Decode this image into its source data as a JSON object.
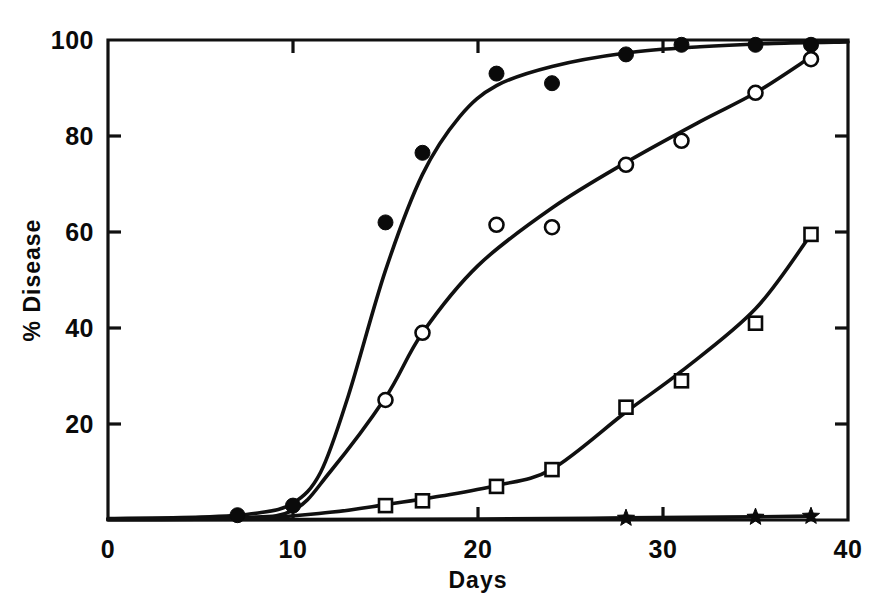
{
  "chart_data": {
    "type": "scatter",
    "title": "",
    "xlabel": "Days",
    "ylabel": "% Disease",
    "xlim": [
      0,
      40
    ],
    "ylim": [
      0,
      100
    ],
    "xticks": [
      0,
      10,
      20,
      30,
      40
    ],
    "yticks": [
      0,
      20,
      40,
      60,
      80,
      100
    ],
    "xtick_labels": [
      "0",
      "10",
      "20",
      "30",
      "40"
    ],
    "ytick_labels": [
      "0",
      "20",
      "40",
      "60",
      "80",
      "100"
    ],
    "grid": false,
    "legend_position": "none",
    "series": [
      {
        "name": "series-filled-circle",
        "marker": "filled-circle",
        "points": [
          {
            "x": 7,
            "y": 1.0
          },
          {
            "x": 10,
            "y": 3.0
          },
          {
            "x": 15,
            "y": 62.0
          },
          {
            "x": 17,
            "y": 76.5
          },
          {
            "x": 21,
            "y": 93.0
          },
          {
            "x": 24,
            "y": 91.0
          },
          {
            "x": 28,
            "y": 97.0
          },
          {
            "x": 31,
            "y": 99.0
          },
          {
            "x": 35,
            "y": 99.0
          },
          {
            "x": 38,
            "y": 99.0
          }
        ],
        "curve": [
          {
            "x": 0,
            "y": 0.3
          },
          {
            "x": 5,
            "y": 0.6
          },
          {
            "x": 8,
            "y": 1.4
          },
          {
            "x": 10,
            "y": 3.5
          },
          {
            "x": 11.5,
            "y": 10.0
          },
          {
            "x": 13,
            "y": 26.0
          },
          {
            "x": 15,
            "y": 52.0
          },
          {
            "x": 17,
            "y": 72.0
          },
          {
            "x": 19,
            "y": 84.0
          },
          {
            "x": 21,
            "y": 90.5
          },
          {
            "x": 24,
            "y": 94.5
          },
          {
            "x": 28,
            "y": 97.3
          },
          {
            "x": 32,
            "y": 98.6
          },
          {
            "x": 36,
            "y": 99.3
          },
          {
            "x": 40,
            "y": 99.6
          }
        ]
      },
      {
        "name": "series-open-circle",
        "marker": "open-circle",
        "points": [
          {
            "x": 15,
            "y": 25.0
          },
          {
            "x": 17,
            "y": 39.0
          },
          {
            "x": 21,
            "y": 61.5
          },
          {
            "x": 24,
            "y": 61.0
          },
          {
            "x": 28,
            "y": 74.0
          },
          {
            "x": 31,
            "y": 79.0
          },
          {
            "x": 35,
            "y": 89.0
          },
          {
            "x": 38,
            "y": 96.0
          }
        ],
        "curve": [
          {
            "x": 0,
            "y": 0.2
          },
          {
            "x": 7,
            "y": 0.5
          },
          {
            "x": 10,
            "y": 2.0
          },
          {
            "x": 12,
            "y": 10.0
          },
          {
            "x": 15,
            "y": 25.5
          },
          {
            "x": 17,
            "y": 39.0
          },
          {
            "x": 20,
            "y": 53.0
          },
          {
            "x": 24,
            "y": 65.0
          },
          {
            "x": 28,
            "y": 74.5
          },
          {
            "x": 32,
            "y": 83.0
          },
          {
            "x": 35,
            "y": 89.0
          },
          {
            "x": 38,
            "y": 96.5
          }
        ]
      },
      {
        "name": "series-open-square",
        "marker": "open-square",
        "points": [
          {
            "x": 15,
            "y": 3.0
          },
          {
            "x": 17,
            "y": 4.0
          },
          {
            "x": 21,
            "y": 7.0
          },
          {
            "x": 24,
            "y": 10.5
          },
          {
            "x": 28,
            "y": 23.5
          },
          {
            "x": 31,
            "y": 29.0
          },
          {
            "x": 35,
            "y": 41.0
          },
          {
            "x": 38,
            "y": 59.5
          }
        ],
        "curve": [
          {
            "x": 0,
            "y": 0.1
          },
          {
            "x": 8,
            "y": 0.4
          },
          {
            "x": 12,
            "y": 1.6
          },
          {
            "x": 15,
            "y": 3.2
          },
          {
            "x": 18,
            "y": 5.0
          },
          {
            "x": 21,
            "y": 7.2
          },
          {
            "x": 24,
            "y": 10.6
          },
          {
            "x": 28,
            "y": 22.5
          },
          {
            "x": 31,
            "y": 31.0
          },
          {
            "x": 35,
            "y": 44.0
          },
          {
            "x": 38,
            "y": 59.5
          }
        ]
      },
      {
        "name": "series-star",
        "marker": "star",
        "points": [
          {
            "x": 28,
            "y": 0.4
          },
          {
            "x": 35,
            "y": 0.6
          },
          {
            "x": 38,
            "y": 0.8
          }
        ],
        "curve": [
          {
            "x": 0,
            "y": 0.05
          },
          {
            "x": 20,
            "y": 0.2
          },
          {
            "x": 28,
            "y": 0.45
          },
          {
            "x": 35,
            "y": 0.65
          },
          {
            "x": 38,
            "y": 0.8
          }
        ]
      }
    ]
  }
}
